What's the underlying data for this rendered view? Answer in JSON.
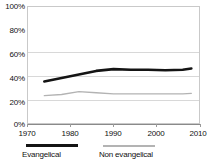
{
  "chart_data": {
    "type": "line",
    "title": "",
    "xlabel": "",
    "ylabel": "",
    "xlim": [
      1970,
      2010
    ],
    "ylim": [
      0,
      100
    ],
    "grid": true,
    "legend_position": "bottom",
    "y_ticks": [
      "0%",
      "20%",
      "40%",
      "60%",
      "80%",
      "100%"
    ],
    "y_tick_values": [
      0,
      20,
      40,
      60,
      80,
      100
    ],
    "x_ticks": [
      "1970",
      "1980",
      "1990",
      "2000",
      "2010"
    ],
    "x_tick_values": [
      1970,
      1980,
      1990,
      2000,
      2010
    ],
    "x": [
      1974,
      1978,
      1982,
      1986,
      1990,
      1994,
      1998,
      2002,
      2006,
      2008
    ],
    "series": [
      {
        "name": "Evangelical",
        "color": "#141414",
        "values": [
          36,
          39,
          42,
          45,
          46.5,
          46,
          46,
          45.5,
          46,
          47
        ]
      },
      {
        "name": "Non evangelical",
        "color": "#b3b3b3",
        "values": [
          24,
          25,
          27.5,
          26.5,
          25.5,
          25.5,
          25.5,
          25.5,
          25.5,
          26
        ]
      }
    ]
  },
  "legend": {
    "items": [
      {
        "label": "Evangelical",
        "color": "#141414"
      },
      {
        "label": "Non evangelical",
        "color": "#b3b3b3"
      }
    ]
  },
  "axes": {
    "y_labels": [
      "100%",
      "80%",
      "60%",
      "40%",
      "20%",
      "0%"
    ],
    "x_labels": [
      "1970",
      "1980",
      "1990",
      "2000",
      "2010"
    ]
  }
}
